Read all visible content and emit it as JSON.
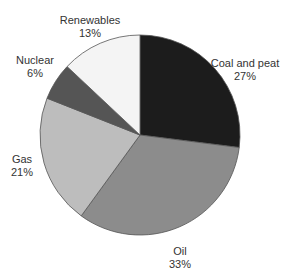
{
  "chart_data": {
    "type": "pie",
    "title": "",
    "start_angle_deg": 90,
    "direction": "clockwise",
    "slices": [
      {
        "label": "Coal and peat",
        "value": 27,
        "pct_label": "27%",
        "color": "#1c1c1c"
      },
      {
        "label": "Oil",
        "value": 33,
        "pct_label": "33%",
        "color": "#8c8c8c"
      },
      {
        "label": "Gas",
        "value": 21,
        "pct_label": "21%",
        "color": "#bdbdbd"
      },
      {
        "label": "Nuclear",
        "value": 6,
        "pct_label": "6%",
        "color": "#555555"
      },
      {
        "label": "Renewables",
        "value": 13,
        "pct_label": "13%",
        "color": "#f4f4f4"
      }
    ],
    "categories": [
      "Coal and peat",
      "Oil",
      "Gas",
      "Nuclear",
      "Renewables"
    ],
    "values": [
      27,
      33,
      21,
      6,
      13
    ],
    "unit": "%"
  },
  "labels": [
    {
      "name": "Coal and peat",
      "pct": "27%",
      "x": 245,
      "y": 57
    },
    {
      "name": "Oil",
      "pct": "33%",
      "x": 180,
      "y": 245
    },
    {
      "name": "Gas",
      "pct": "21%",
      "x": 22,
      "y": 153
    },
    {
      "name": "Nuclear",
      "pct": "6%",
      "x": 35,
      "y": 54
    },
    {
      "name": "Renewables",
      "pct": "13%",
      "x": 90,
      "y": 14
    }
  ]
}
